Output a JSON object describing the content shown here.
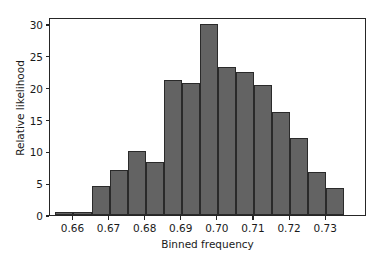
{
  "chart_data": {
    "type": "bar",
    "title": "",
    "subtitle": "",
    "xlabel": "Binned frequency",
    "ylabel": "Relative likelihood",
    "xlim": [
      0.6535,
      0.7413
    ],
    "ylim": [
      0,
      31.1
    ],
    "grid": false,
    "legend": null,
    "bin_width": 0.005,
    "bar_color": "#636363",
    "bar_edge_color": "#2a2a2a",
    "xticks": [
      "0.66",
      "0.67",
      "0.68",
      "0.69",
      "0.70",
      "0.71",
      "0.72",
      "0.73"
    ],
    "xtick_values": [
      0.66,
      0.67,
      0.68,
      0.69,
      0.7,
      0.71,
      0.72,
      0.73
    ],
    "yticks": [
      "0",
      "5",
      "10",
      "15",
      "20",
      "25",
      "30"
    ],
    "ytick_values": [
      0,
      5,
      10,
      15,
      20,
      25,
      30
    ],
    "bins": [
      {
        "left": 0.655,
        "right": 0.66,
        "center": 0.6575,
        "value": 0.4
      },
      {
        "left": 0.66,
        "right": 0.665,
        "center": 0.6625,
        "value": 0.4
      },
      {
        "left": 0.665,
        "right": 0.67,
        "center": 0.6675,
        "value": 4.6
      },
      {
        "left": 0.67,
        "right": 0.675,
        "center": 0.6725,
        "value": 7.1
      },
      {
        "left": 0.675,
        "right": 0.68,
        "center": 0.6775,
        "value": 10.0
      },
      {
        "left": 0.68,
        "right": 0.685,
        "center": 0.6825,
        "value": 8.4
      },
      {
        "left": 0.685,
        "right": 0.69,
        "center": 0.6875,
        "value": 21.2
      },
      {
        "left": 0.69,
        "right": 0.695,
        "center": 0.6925,
        "value": 20.8
      },
      {
        "left": 0.695,
        "right": 0.7,
        "center": 0.6975,
        "value": 30.0
      },
      {
        "left": 0.7,
        "right": 0.705,
        "center": 0.7025,
        "value": 23.3
      },
      {
        "left": 0.705,
        "right": 0.71,
        "center": 0.7075,
        "value": 22.5
      },
      {
        "left": 0.71,
        "right": 0.715,
        "center": 0.7125,
        "value": 20.4
      },
      {
        "left": 0.715,
        "right": 0.72,
        "center": 0.7175,
        "value": 16.2
      },
      {
        "left": 0.72,
        "right": 0.725,
        "center": 0.7225,
        "value": 12.1
      },
      {
        "left": 0.725,
        "right": 0.73,
        "center": 0.7275,
        "value": 6.7
      },
      {
        "left": 0.73,
        "right": 0.735,
        "center": 0.7325,
        "value": 4.3
      }
    ],
    "categories": [
      0.6575,
      0.6625,
      0.6675,
      0.6725,
      0.6775,
      0.6825,
      0.6875,
      0.6925,
      0.6975,
      0.7025,
      0.7075,
      0.7125,
      0.7175,
      0.7225,
      0.7275,
      0.7325
    ],
    "values": [
      0.4,
      0.4,
      4.6,
      7.1,
      10.0,
      8.4,
      21.2,
      20.8,
      30.0,
      23.3,
      22.5,
      20.4,
      16.2,
      12.1,
      6.7,
      4.3
    ]
  }
}
